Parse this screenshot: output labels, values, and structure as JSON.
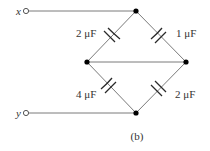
{
  "diagram": {
    "type": "capacitor-bridge-circuit",
    "caption": "(b)",
    "terminals": [
      {
        "id": "x",
        "label": "x"
      },
      {
        "id": "y",
        "label": "y"
      }
    ],
    "capacitors": [
      {
        "id": "c_top_left",
        "label": "2 μF",
        "between": [
          "left-node",
          "top-node"
        ]
      },
      {
        "id": "c_top_right",
        "label": "1 μF",
        "between": [
          "top-node",
          "right-node"
        ]
      },
      {
        "id": "c_bottom_left",
        "label": "4 μF",
        "between": [
          "left-node",
          "bottom-node"
        ]
      },
      {
        "id": "c_bottom_right",
        "label": "2 μF",
        "between": [
          "bottom-node",
          "right-node"
        ]
      }
    ],
    "connections": [
      "x terminal to top-node",
      "y terminal to bottom-node",
      "left-node to right-node (wire)"
    ]
  }
}
